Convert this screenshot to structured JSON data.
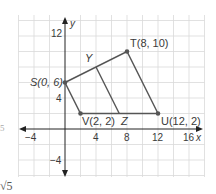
{
  "figure": {
    "type": "coordinate-plane-quadrilateral",
    "axes": {
      "x_label": "x",
      "y_label": "y",
      "x_ticks": [
        "−4",
        "4",
        "8",
        "12",
        "16"
      ],
      "y_ticks": [
        "12",
        "4",
        "−4"
      ],
      "grid_step_units": 2
    },
    "points": [
      {
        "name": "S",
        "x": 0,
        "y": 6,
        "label": "S(0, 6)"
      },
      {
        "name": "T",
        "x": 8,
        "y": 10,
        "label": "T(8, 10)"
      },
      {
        "name": "U",
        "x": 12,
        "y": 2,
        "label": "U(12, 2)"
      },
      {
        "name": "V",
        "x": 2,
        "y": 2,
        "label": "V(2, 2)"
      },
      {
        "name": "Y",
        "label": "Y"
      },
      {
        "name": "Z",
        "label": "Z"
      }
    ],
    "segments": [
      "ST",
      "TU",
      "UV",
      "VS",
      "YZ"
    ],
    "colors": {
      "grid": "#d9d9d9",
      "axis": "#222222",
      "shape": "#555555",
      "point": "#555555"
    }
  },
  "margin_text": {
    "left_mark": "5",
    "bottom_left": "√5"
  }
}
